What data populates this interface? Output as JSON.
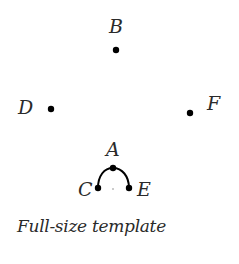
{
  "diagram": {
    "points": [
      {
        "label": "B",
        "x": 116,
        "y": 50,
        "lx": 109,
        "ly": 33
      },
      {
        "label": "D",
        "x": 51,
        "y": 109,
        "lx": 18,
        "ly": 114
      },
      {
        "label": "F",
        "x": 190,
        "y": 113,
        "lx": 207,
        "ly": 110
      },
      {
        "label": "A",
        "x": 113,
        "y": 168,
        "lx": 106,
        "ly": 156
      },
      {
        "label": "C",
        "x": 98,
        "y": 188,
        "lx": 78,
        "ly": 196
      },
      {
        "label": "E",
        "x": 129,
        "y": 188,
        "lx": 137,
        "ly": 196
      }
    ],
    "caption": "Full-size template",
    "colors": {
      "dot": "#000000",
      "text": "#2a2a2a"
    }
  }
}
